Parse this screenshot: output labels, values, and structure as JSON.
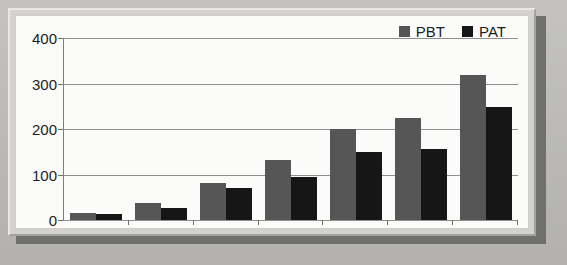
{
  "chart_data": {
    "type": "bar",
    "title": "",
    "xlabel": "",
    "ylabel": "",
    "ylim": [
      0,
      400
    ],
    "yticks": [
      0,
      100,
      200,
      300,
      400
    ],
    "grid": true,
    "legend_position": "top-right",
    "categories": [
      "2003-04",
      "2004-05",
      "2005-06",
      "2006-07",
      "2007-08",
      "2008-09",
      "2009-10"
    ],
    "series": [
      {
        "name": "PBT",
        "color": "#565656",
        "values": [
          15,
          37,
          81,
          132,
          202,
          226,
          321
        ]
      },
      {
        "name": "PAT",
        "color": "#161616",
        "values": [
          13,
          26,
          70,
          95,
          150,
          158,
          250
        ]
      }
    ]
  },
  "legend": {
    "items": [
      {
        "label": "PBT",
        "swatch": "legend-swatch-pbt"
      },
      {
        "label": "PAT",
        "swatch": "legend-swatch-pat"
      }
    ]
  },
  "axis": {
    "y_labels": [
      "400",
      "300",
      "200",
      "100",
      "0"
    ]
  }
}
